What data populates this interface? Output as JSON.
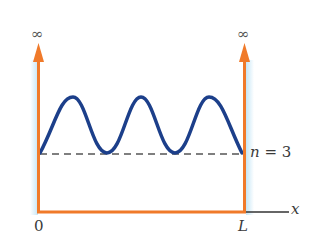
{
  "diagram": {
    "walls": {
      "left_top_label": "∞",
      "right_top_label": "∞",
      "color": "#f07a2a",
      "glow_color": "#bfe3f5"
    },
    "x_axis": {
      "origin_label": "0",
      "right_label": "L",
      "axis_label": "x"
    },
    "state": {
      "label": "n = 3",
      "n_italic": "n",
      "equals": "= 3",
      "curve_color": "#1c3f8a",
      "dashed_line_color": "#555555"
    }
  }
}
